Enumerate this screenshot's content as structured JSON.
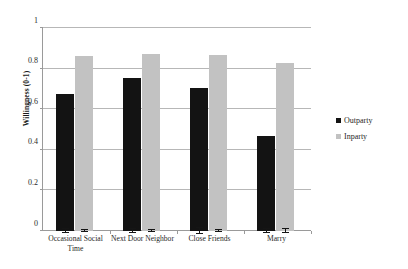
{
  "chart_data": {
    "type": "bar",
    "title": "",
    "subtitle": "",
    "xlabel": "",
    "ylabel": "Willingness (0-1)",
    "ylim": [
      0,
      1
    ],
    "yticks": [
      "0",
      "0.2",
      "0.4",
      "0.6",
      "0.8",
      "1"
    ],
    "ytick_values": [
      0,
      0.2,
      0.4,
      0.6,
      0.8,
      1
    ],
    "grid": "horizontal",
    "legend_position": "right",
    "categories": [
      "Occasional Social Time",
      "Next Door Neighbor",
      "Close Friends",
      "Marry"
    ],
    "series": [
      {
        "name": "Outparty",
        "color": "#131313",
        "values": [
          0.675,
          0.752,
          0.706,
          0.469
        ],
        "errors": [
          0.012,
          0.008,
          0.013,
          0.012
        ]
      },
      {
        "name": "Inparty",
        "color": "#c2c2c2",
        "values": [
          0.864,
          0.874,
          0.867,
          0.828
        ],
        "errors": [
          0.006,
          0.006,
          0.007,
          0.009
        ]
      }
    ]
  },
  "legend": {
    "items": [
      {
        "label": "Outparty",
        "marker": "square-black"
      },
      {
        "label": "Inparty",
        "marker": "square-gray"
      }
    ]
  }
}
